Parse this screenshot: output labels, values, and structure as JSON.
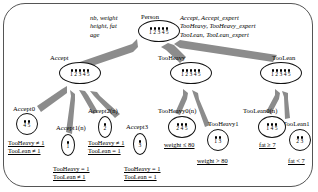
{
  "diagram": {
    "frame_color": "#555555",
    "arrow_color": "#8c8c8c",
    "node_border_color": "#111111"
  },
  "header_left": {
    "lines": [
      "nb, weight",
      "height, fat",
      "age"
    ]
  },
  "header_right": {
    "lines": [
      "Accept, Accept_expert",
      "TooHeavy, TooHeavy_expert",
      "TooLean, TooLean_expert"
    ]
  },
  "nodes": [
    {
      "id": "person",
      "label": "Person",
      "slots": [
        "1",
        "2",
        "3",
        "4",
        "5"
      ]
    },
    {
      "id": "accept",
      "label": "Accept",
      "slots": [
        "1",
        "2",
        "3",
        "4",
        "5"
      ]
    },
    {
      "id": "tooheavy",
      "label": "TooHeavy",
      "slots": [
        "1",
        "2",
        "3",
        "4",
        "5"
      ]
    },
    {
      "id": "toolean",
      "label": "TooLean",
      "slots": [
        "1",
        "2",
        "3",
        "4",
        "5"
      ]
    },
    {
      "id": "accept0",
      "label": "Accept0",
      "slots": [
        "4",
        "5"
      ]
    },
    {
      "id": "accept1",
      "label": "Accept1(n)",
      "slots": [
        "1"
      ]
    },
    {
      "id": "accept2",
      "label": "Accept2(n)",
      "slots": [
        "2"
      ]
    },
    {
      "id": "accept3",
      "label": "Accept3",
      "slots": [
        "3"
      ]
    },
    {
      "id": "tooheavy0",
      "label": "TooHeavy0(n)",
      "slots": [
        "2",
        "4",
        "5"
      ]
    },
    {
      "id": "tooheavy1",
      "label": "TooHeavy1",
      "slots": [
        "1",
        "3"
      ]
    },
    {
      "id": "toolean0",
      "label": "TooLean0(n)",
      "slots": [
        "1",
        "4",
        "5"
      ]
    },
    {
      "id": "toolean1",
      "label": "TooLean1",
      "slots": [
        "2",
        "3"
      ]
    }
  ],
  "conditions": [
    {
      "id": "cond-accept0",
      "lines": [
        "TooHeavy ≠ 1",
        "TooLean ≠ 1"
      ]
    },
    {
      "id": "cond-accept1",
      "lines": [
        "TooHeavy = 1",
        "TooLean ≠ 1"
      ]
    },
    {
      "id": "cond-accept2",
      "lines": [
        "TooHeavy ≠ 1",
        "TooLean = 1"
      ]
    },
    {
      "id": "cond-accept3",
      "lines": [
        "TooHeavy = 1",
        "TooLean = 1"
      ]
    },
    {
      "id": "cond-tooheavy0",
      "lines": [
        "weight ≤ 80"
      ]
    },
    {
      "id": "cond-tooheavy1",
      "lines": [
        "weight > 80"
      ]
    },
    {
      "id": "cond-toolean0",
      "lines": [
        "fat ≥ 7"
      ]
    },
    {
      "id": "cond-toolean1",
      "lines": [
        "fat < 7"
      ]
    }
  ]
}
